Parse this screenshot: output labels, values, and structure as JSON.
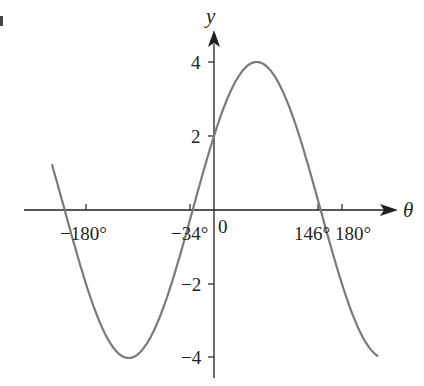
{
  "chart_data": {
    "type": "line",
    "title": "",
    "xlabel": "θ",
    "ylabel": "y",
    "function_shown": "y = 4 sin(θ + 30°)",
    "x_tick_labels": [
      "−180°",
      "−34°",
      "0",
      "146°",
      "180°"
    ],
    "x_ticks_deg": [
      -180,
      -34,
      0,
      146,
      180
    ],
    "y_tick_labels": [
      "4",
      "2",
      "−2",
      "−4"
    ],
    "y_ticks": [
      4,
      2,
      -2,
      -4
    ],
    "xlim": [
      -228,
      231
    ],
    "ylim": [
      -4.2,
      4.6
    ],
    "grid": false,
    "legend": null,
    "series": [
      {
        "name": "curve",
        "color": "#7a7a7a",
        "x": [
          -228,
          -210,
          -180,
          -150,
          -120,
          -90,
          -60,
          -34,
          0,
          30,
          60,
          90,
          120,
          146,
          180,
          210,
          231
        ],
        "values": [
          1.24,
          0,
          -2,
          -3.46,
          -4,
          -3.46,
          -2,
          -0.28,
          2,
          3.46,
          4,
          3.46,
          2,
          0.28,
          -2,
          -3.46,
          -3.95
        ]
      }
    ],
    "key_points": {
      "y_intercept": 2,
      "roots_deg": [
        -34,
        146
      ],
      "max": {
        "x": 60,
        "y": 4
      },
      "min": {
        "x": -120,
        "y": -4
      }
    }
  },
  "labels": {
    "y_axis": "y",
    "x_axis": "θ",
    "origin": "0",
    "x_neg180": "−180°",
    "x_neg34": "−34°",
    "x_146": "146°",
    "x_180": "180°",
    "y_4": "4",
    "y_2": "2",
    "y_neg2": "−2",
    "y_neg4": "−4"
  }
}
